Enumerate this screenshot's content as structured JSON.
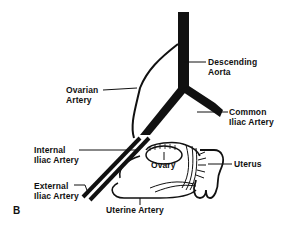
{
  "figure": {
    "panel_label": "B"
  },
  "labels": {
    "descending_aorta": [
      "Descending",
      "Aorta"
    ],
    "ovarian_artery": [
      "Ovarian",
      "Artery"
    ],
    "common_iliac_artery": [
      "Common",
      "Iliac Artery"
    ],
    "internal_iliac_artery": [
      "Internal",
      "Iliac Artery"
    ],
    "external_iliac_artery": [
      "External",
      "Iliac Artery"
    ],
    "ovary": "Ovary",
    "uterus": "Uterus",
    "uterine_artery": "Uterine Artery"
  },
  "colors": {
    "ink": "#111111",
    "background": "#ffffff"
  }
}
